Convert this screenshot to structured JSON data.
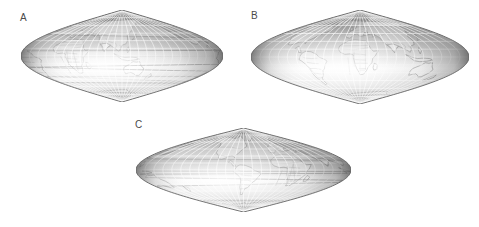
{
  "figure": {
    "background_color": "#ffffff",
    "label_color": "#4a4a4a",
    "panels": [
      {
        "id": "A",
        "label": "A",
        "label_x": 20,
        "label_y": 13,
        "x": 21,
        "y": 10,
        "width": 202,
        "height": 92,
        "projection": "sinusoidal-lens-shaded-globe",
        "center_longitude": 110,
        "center_latitude": 0,
        "view_description": "Asia, Australia and Indian Ocean hemisphere",
        "graticule_spacing_degrees": 15,
        "shading": {
          "light_color": "#fdfdfd",
          "mid_color": "#c9c9c9",
          "dark_color": "#636363",
          "edge_color": "#555555"
        },
        "coastline_color": "#6e6e6e",
        "border_color": "#8a8a8a",
        "graticule_color": "#ffffff"
      },
      {
        "id": "B",
        "label": "B",
        "label_x": 251,
        "label_y": 11,
        "x": 251,
        "y": 10,
        "width": 218,
        "height": 94,
        "projection": "sinusoidal-lens-shaded-globe",
        "center_longitude": 20,
        "center_latitude": 0,
        "view_description": "Africa, Europe and Atlantic hemisphere with country borders",
        "graticule_spacing_degrees": 15,
        "shading": {
          "light_color": "#fdfdfd",
          "mid_color": "#cccccc",
          "dark_color": "#666666",
          "edge_color": "#555555"
        },
        "coastline_color": "#707070",
        "border_color": "#909090",
        "graticule_color": "#ffffff"
      },
      {
        "id": "C",
        "label": "C",
        "label_x": 135,
        "label_y": 120,
        "x": 136,
        "y": 128,
        "width": 215,
        "height": 84,
        "projection": "sinusoidal-lens-shaded-globe",
        "center_longitude": -65,
        "center_latitude": 0,
        "view_description": "South America, Antarctica and Pacific hemisphere",
        "graticule_spacing_degrees": 15,
        "shading": {
          "light_color": "#fcfcfc",
          "mid_color": "#c7c7c7",
          "dark_color": "#646464",
          "edge_color": "#555555"
        },
        "coastline_color": "#6e6e6e",
        "border_color": "#8d8d8d",
        "graticule_color": "#ffffff"
      }
    ]
  }
}
